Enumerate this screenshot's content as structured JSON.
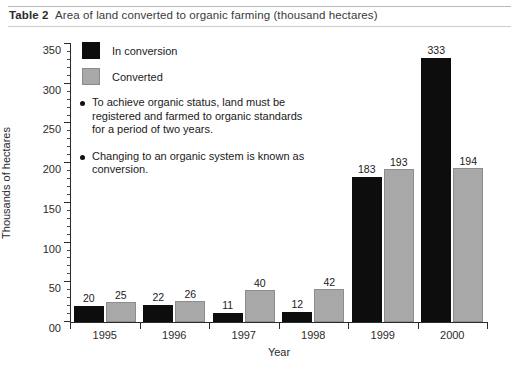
{
  "caption": {
    "label": "Table 2",
    "text": "Area of land converted to organic farming (thousand hectares)"
  },
  "chart_data": {
    "type": "bar",
    "title": "Area of land converted to organic farming (thousand hectares)",
    "xlabel": "Year",
    "ylabel": "Thousands of hectares",
    "categories": [
      "1995",
      "1996",
      "1997",
      "1998",
      "1999",
      "2000"
    ],
    "series": [
      {
        "name": "In conversion",
        "color": "#0d0d0d",
        "values": [
          20,
          22,
          11,
          12,
          183,
          333
        ]
      },
      {
        "name": "Converted",
        "color": "#a8a8a8",
        "values": [
          25,
          26,
          40,
          42,
          193,
          194
        ]
      }
    ],
    "ylim": [
      0,
      350
    ],
    "ytick_labels": [
      "00",
      "50",
      "100",
      "150",
      "200",
      "250",
      "300",
      "350"
    ],
    "ytick_values": [
      0,
      50,
      100,
      150,
      200,
      250,
      300,
      350
    ],
    "ytick_minor_step": 10,
    "grid": false,
    "legend_position": "top-left",
    "data_labels": true
  },
  "legend": {
    "items": [
      {
        "label": "In conversion",
        "swatch": "in-conversion"
      },
      {
        "label": "Converted",
        "swatch": "converted"
      }
    ]
  },
  "annotations": [
    {
      "text": "To achieve organic status, land must be registered and farmed to organic standards for a period of two years."
    },
    {
      "text": "Changing to an organic system is known as conversion."
    }
  ]
}
